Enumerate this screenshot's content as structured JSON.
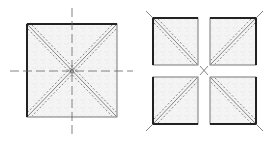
{
  "figure": {
    "colors": {
      "background": "#ffffff",
      "fill": "#f3f3f3",
      "stroke": "#333333",
      "thick_edge": "#222222",
      "dash": "#666666"
    },
    "left_panel": {
      "label": "single-square",
      "square": {
        "x": 27,
        "y": 24,
        "w": 90,
        "h": 93
      }
    },
    "right_panel": {
      "label": "four-squares",
      "squares": [
        {
          "x": 153,
          "y": 18,
          "w": 45,
          "h": 47,
          "diagonal": "tl-br"
        },
        {
          "x": 210,
          "y": 18,
          "w": 46,
          "h": 47,
          "diagonal": "bl-tr"
        },
        {
          "x": 153,
          "y": 77,
          "w": 45,
          "h": 47,
          "diagonal": "bl-tr"
        },
        {
          "x": 210,
          "y": 77,
          "w": 46,
          "h": 47,
          "diagonal": "tl-br"
        }
      ]
    }
  }
}
